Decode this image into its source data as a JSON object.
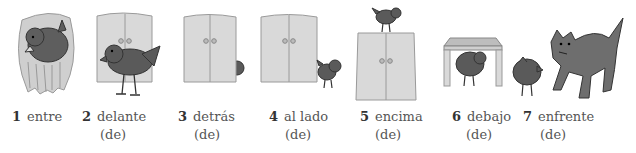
{
  "items": [
    {
      "number": "1",
      "word": "entre",
      "sub": "",
      "icon": "bird-in-hands"
    },
    {
      "number": "2",
      "word": "delante",
      "sub": "(de)",
      "icon": "bird-in-front-of-wardrobe"
    },
    {
      "number": "3",
      "word": "detrás",
      "sub": "(de)",
      "icon": "bird-behind-wardrobe"
    },
    {
      "number": "4",
      "word": "al lado",
      "sub": "(de)",
      "icon": "bird-beside-wardrobe"
    },
    {
      "number": "5",
      "word": "encima",
      "sub": "(de)",
      "icon": "bird-on-top-of-wardrobe"
    },
    {
      "number": "6",
      "word": "debajo",
      "sub": "(de)",
      "icon": "bird-under-table"
    },
    {
      "number": "7",
      "word": "enfrente",
      "sub": "(de)",
      "icon": "bird-facing-cat"
    }
  ],
  "colors": {
    "bird": "#5a5a5a",
    "wardrobe": "#d8d8d8",
    "wardrobe_edge": "#9a9a9a",
    "hands": "#c4c4c4",
    "cat": "#6e6e6e",
    "text": "#555555"
  }
}
